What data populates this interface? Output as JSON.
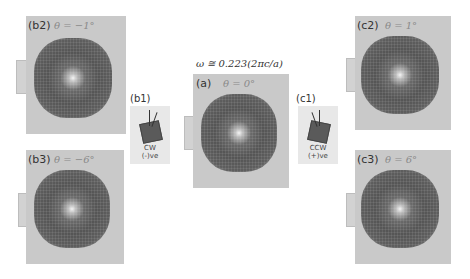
{
  "figure": {
    "frequency_label": "ω ≅ 0.223(2πc/a)",
    "panels": [
      {
        "id": "b2",
        "label": "(b2)",
        "theta": "θ = −1°"
      },
      {
        "id": "b3",
        "label": "(b3)",
        "theta": "θ = −6°"
      },
      {
        "id": "a",
        "label": "(a)",
        "theta": "θ = 0°"
      },
      {
        "id": "c2",
        "label": "(c2)",
        "theta": "θ = 1°"
      },
      {
        "id": "c3",
        "label": "(c3)",
        "theta": "θ = 6°"
      }
    ],
    "insets": [
      {
        "id": "b1",
        "label": "(b1)",
        "rotation": "CW",
        "sign": "(-)ve",
        "angle_symbol": "θ"
      },
      {
        "id": "c1",
        "label": "(c1)",
        "rotation": "CCW",
        "sign": "(+)ve",
        "angle_symbol": "θ"
      }
    ]
  }
}
